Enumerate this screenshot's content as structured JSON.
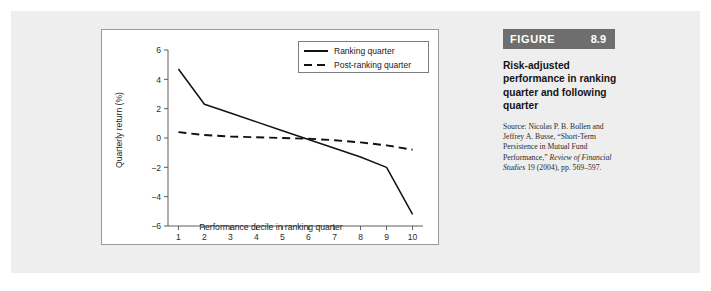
{
  "figure": {
    "tag_word": "FIGURE",
    "tag_number": "8.9",
    "caption_title": "Risk-adjusted performance in ranking quarter and following quarter",
    "source_line1": "Source: Nicolas P. B. Bollen",
    "source_line2": "and Jeffrey A. Busse,",
    "source_line3": "“Short-Term Persistence in",
    "source_line4": "Mutual Fund Performance,”",
    "source_line5_italic": "Review of Financial Studies",
    "source_line6": "19 (2004), pp. 569–597."
  },
  "chart_data": {
    "type": "line",
    "title": "",
    "xlabel": "Performance decile in ranking quarter",
    "ylabel": "Quarterly return (%)",
    "x": [
      1,
      2,
      3,
      4,
      5,
      6,
      7,
      8,
      9,
      10
    ],
    "xtick_labels": [
      "1",
      "2",
      "3",
      "4",
      "5",
      "6",
      "7",
      "8",
      "9",
      "10"
    ],
    "ytick_labels": [
      "6",
      "4",
      "2",
      "0",
      "−2",
      "−4",
      "−6"
    ],
    "ytick_values": [
      6,
      4,
      2,
      0,
      -2,
      -4,
      -6
    ],
    "xlim": [
      0.6,
      10.4
    ],
    "ylim": [
      -6,
      6
    ],
    "grid": false,
    "legend_position": "top-right",
    "series": [
      {
        "name": "Ranking quarter",
        "style": "solid",
        "color": "#111111",
        "values": [
          4.7,
          2.3,
          1.7,
          1.1,
          0.5,
          -0.1,
          -0.7,
          -1.3,
          -2.0,
          -5.2
        ]
      },
      {
        "name": "Post-ranking quarter",
        "style": "dashed",
        "color": "#111111",
        "values": [
          0.4,
          0.2,
          0.1,
          0.05,
          0.0,
          -0.05,
          -0.15,
          -0.3,
          -0.5,
          -0.8
        ]
      }
    ]
  }
}
